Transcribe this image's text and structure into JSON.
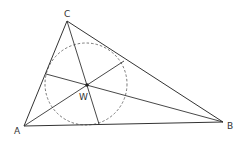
{
  "diagram": {
    "type": "triangle-incircle",
    "vertices": {
      "A": {
        "label": "A",
        "x": 24,
        "y": 126
      },
      "B": {
        "label": "B",
        "x": 223,
        "y": 122
      },
      "C": {
        "label": "C",
        "x": 67,
        "y": 21
      }
    },
    "incenter": {
      "label": "W",
      "x": 87,
      "y": 85
    },
    "incircle": {
      "cx": 86,
      "cy": 84,
      "r": 41,
      "style": "dashed"
    },
    "angle_bisectors": [
      {
        "from": "A",
        "to_x": 124,
        "to_y": 61
      },
      {
        "from": "B",
        "to_x": 46,
        "to_y": 74
      },
      {
        "from": "C",
        "to_x": 99,
        "to_y": 124
      }
    ],
    "colors": {
      "line": "#333333",
      "background": "#ffffff"
    }
  }
}
